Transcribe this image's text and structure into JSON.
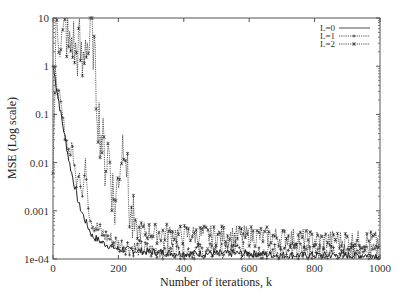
{
  "chart_data": {
    "type": "line",
    "title": "",
    "xlabel": "Number of iterations, k",
    "ylabel": "MSE (Log scale)",
    "yscale": "log",
    "xlim": [
      0,
      1000
    ],
    "ylim": [
      0.0001,
      10
    ],
    "x_ticks": [
      0,
      200,
      400,
      600,
      800,
      1000
    ],
    "x_tick_labels": [
      "0",
      "200",
      "400",
      "600",
      "800",
      "1000"
    ],
    "y_ticks": [
      0.0001,
      0.001,
      0.01,
      0.1,
      1,
      10
    ],
    "y_tick_labels": [
      "1e-04",
      "0.001",
      "0.01",
      "0.1",
      "1",
      "10"
    ],
    "grid": false,
    "legend_position": "top-right inside",
    "series": [
      {
        "name": "L=0",
        "style": "solid",
        "marker": "none",
        "x": [
          0,
          10,
          20,
          30,
          40,
          50,
          60,
          70,
          80,
          100,
          120,
          150,
          200,
          300,
          400,
          500,
          600,
          700,
          800,
          900,
          1000
        ],
        "values": [
          1.0,
          0.4,
          0.15,
          0.06,
          0.025,
          0.01,
          0.005,
          0.0025,
          0.0013,
          0.0006,
          0.0003,
          0.00022,
          0.00016,
          0.00014,
          0.00013,
          0.00013,
          0.00013,
          0.00012,
          0.00012,
          0.00012,
          0.00012
        ]
      },
      {
        "name": "L=1",
        "style": "dotted",
        "marker": "+",
        "x": [
          0,
          10,
          20,
          30,
          40,
          50,
          60,
          70,
          80,
          90,
          100,
          110,
          120,
          140,
          160,
          180,
          200,
          250,
          300,
          400,
          500,
          600,
          700,
          800,
          900,
          1000
        ],
        "values": [
          1.0,
          0.5,
          0.2,
          0.08,
          0.03,
          0.015,
          0.02,
          0.004,
          0.008,
          0.002,
          0.01,
          0.001,
          0.0006,
          0.0004,
          0.0003,
          0.00025,
          0.0002,
          0.00017,
          0.00015,
          0.00015,
          0.00014,
          0.00015,
          0.00014,
          0.00014,
          0.00014,
          0.00014
        ]
      },
      {
        "name": "L=2",
        "style": "dotted",
        "marker": "*",
        "x": [
          0,
          10,
          20,
          30,
          40,
          50,
          60,
          70,
          80,
          90,
          100,
          110,
          120,
          130,
          140,
          150,
          160,
          170,
          180,
          190,
          200,
          210,
          220,
          230,
          240,
          250,
          300,
          400,
          500,
          600,
          700,
          800,
          900,
          1000
        ],
        "values": [
          0.006,
          8,
          5,
          3,
          6,
          2,
          4,
          1.5,
          3,
          0.8,
          5,
          2,
          8,
          0.5,
          0.08,
          0.03,
          0.01,
          0.02,
          0.004,
          0.001,
          0.006,
          0.02,
          0.05,
          0.002,
          0.0006,
          0.0004,
          0.00035,
          0.00032,
          0.0003,
          0.0003,
          0.00028,
          0.00025,
          0.00024,
          0.00023
        ]
      }
    ]
  }
}
